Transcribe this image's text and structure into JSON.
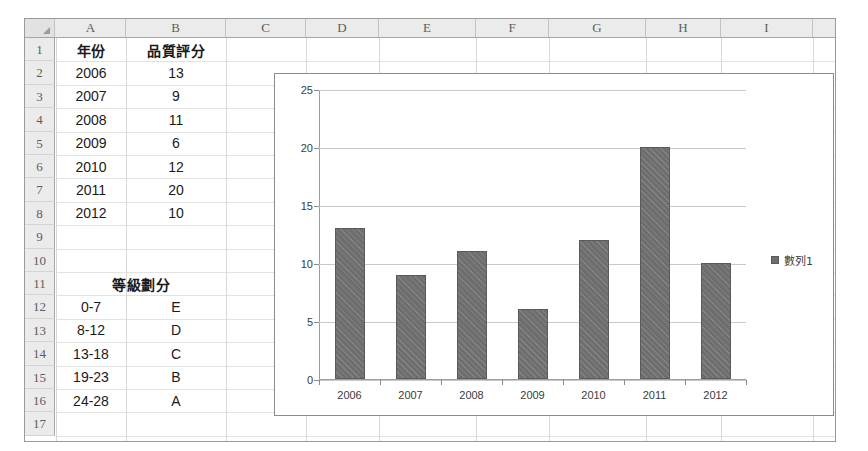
{
  "sheet": {
    "column_headers": [
      "A",
      "B",
      "C",
      "D",
      "E",
      "F",
      "G",
      "H",
      "I"
    ],
    "row_headers": [
      "1",
      "2",
      "3",
      "4",
      "5",
      "6",
      "7",
      "8",
      "9",
      "10",
      "11",
      "12",
      "13",
      "14",
      "15",
      "16",
      "17"
    ],
    "corner_icon": "select-all-triangle-icon",
    "cells": [
      {
        "row": 1,
        "col": "A",
        "value": "年份",
        "cjk": true
      },
      {
        "row": 1,
        "col": "B",
        "value": "品質評分",
        "cjk": true
      },
      {
        "row": 2,
        "col": "A",
        "value": "2006"
      },
      {
        "row": 2,
        "col": "B",
        "value": "13"
      },
      {
        "row": 3,
        "col": "A",
        "value": "2007"
      },
      {
        "row": 3,
        "col": "B",
        "value": "9"
      },
      {
        "row": 4,
        "col": "A",
        "value": "2008"
      },
      {
        "row": 4,
        "col": "B",
        "value": "11"
      },
      {
        "row": 5,
        "col": "A",
        "value": "2009"
      },
      {
        "row": 5,
        "col": "B",
        "value": "6"
      },
      {
        "row": 6,
        "col": "A",
        "value": "2010"
      },
      {
        "row": 6,
        "col": "B",
        "value": "12"
      },
      {
        "row": 7,
        "col": "A",
        "value": "2011"
      },
      {
        "row": 7,
        "col": "B",
        "value": "20"
      },
      {
        "row": 8,
        "col": "A",
        "value": "2012"
      },
      {
        "row": 8,
        "col": "B",
        "value": "10"
      },
      {
        "row": 11,
        "col": "AB",
        "value": "等級劃分",
        "cjk": true
      },
      {
        "row": 12,
        "col": "A",
        "value": "0-7"
      },
      {
        "row": 12,
        "col": "B",
        "value": "E"
      },
      {
        "row": 13,
        "col": "A",
        "value": "8-12"
      },
      {
        "row": 13,
        "col": "B",
        "value": "D"
      },
      {
        "row": 14,
        "col": "A",
        "value": "13-18"
      },
      {
        "row": 14,
        "col": "B",
        "value": "C"
      },
      {
        "row": 15,
        "col": "A",
        "value": "19-23"
      },
      {
        "row": 15,
        "col": "B",
        "value": "B"
      },
      {
        "row": 16,
        "col": "A",
        "value": "24-28"
      },
      {
        "row": 16,
        "col": "B",
        "value": "A"
      }
    ]
  },
  "chart_data": {
    "type": "bar",
    "title": "",
    "categories": [
      "2006",
      "2007",
      "2008",
      "2009",
      "2010",
      "2011",
      "2012"
    ],
    "series": [
      {
        "name": "數列1",
        "values": [
          13,
          9,
          11,
          6,
          12,
          20,
          10
        ]
      }
    ],
    "xlabel": "",
    "ylabel": "",
    "ylim": [
      0,
      25
    ],
    "yticks": [
      0,
      5,
      10,
      15,
      20,
      25
    ],
    "grid": true,
    "legend_position": "right",
    "bar_color": "#6e6e6e"
  }
}
